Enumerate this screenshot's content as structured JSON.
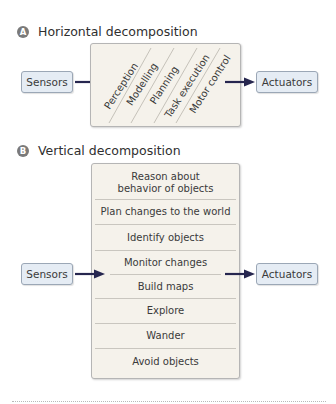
{
  "sections": {
    "horizontal": {
      "badge": "A",
      "title": "Horizontal decomposition",
      "input": "Sensors",
      "output": "Actuators",
      "layers": [
        "Perception",
        "Modelling",
        "Planning",
        "Task execution",
        "Motor control"
      ]
    },
    "vertical": {
      "badge": "B",
      "title": "Vertical decomposition",
      "input": "Sensors",
      "output": "Actuators",
      "layers": [
        "Reason about behavior of objects",
        "Plan changes to the world",
        "Identify objects",
        "Monitor changes",
        "Build maps",
        "Explore",
        "Wander",
        "Avoid objects"
      ]
    }
  },
  "colors": {
    "arrow": "#26264f",
    "node_fill": "#e5ecf4",
    "panel_fill": "#f5f2eb",
    "badge": "#7a7a7a"
  }
}
